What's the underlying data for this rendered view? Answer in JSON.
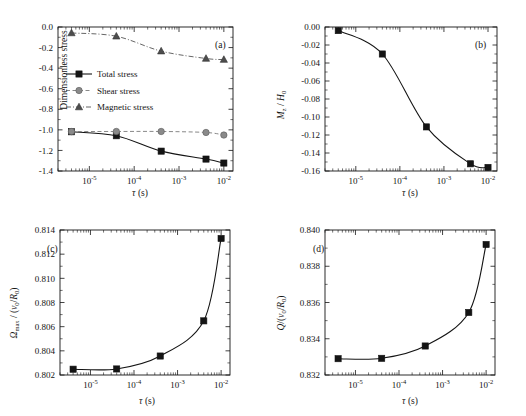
{
  "figure": {
    "background_color": "#ffffff",
    "foreground_color": "#141414",
    "shear_color": "#8a8a8a",
    "magnetic_color": "#4d4d4d"
  },
  "panels": {
    "a": {
      "tag": "(a)",
      "ylabel": "Dimensionless stress",
      "xlabel_tau": "τ",
      "xlabel_unit": " (s)",
      "ytick_labels": [
        "0.0",
        "-0.2",
        "-0.4",
        "-0.6",
        "-0.8",
        "-1.0",
        "-1.2",
        "-1.4"
      ],
      "xtick_labels": [
        "10",
        "10",
        "10",
        "10"
      ],
      "xtick_exponents": [
        "-5",
        "-4",
        "-3",
        "-2"
      ],
      "legend": [
        {
          "label": "Total stress",
          "marker": "square",
          "line": "solid"
        },
        {
          "label": "Shear stress",
          "marker": "circle",
          "line": "dashed"
        },
        {
          "label": "Magnetic stress",
          "marker": "triangle",
          "line": "dashdot"
        }
      ]
    },
    "b": {
      "tag": "(b)",
      "ylabel_m": "M",
      "ylabel_msub": "z",
      "ylabel_mid": " / ",
      "ylabel_h": "H",
      "ylabel_hsub": "0",
      "xlabel_tau": "τ",
      "xlabel_unit": " (s)",
      "ytick_labels": [
        "0.00",
        "-0.02",
        "-0.04",
        "-0.06",
        "-0.08",
        "-0.10",
        "-0.12",
        "-0.14",
        "-0.16"
      ],
      "xtick_exponents": [
        "-5",
        "-4",
        "-3",
        "-2"
      ]
    },
    "c": {
      "tag": "(c)",
      "ylabel_omega": "Ω",
      "ylabel_omegasub": "max",
      "ylabel_rest1": " / (",
      "ylabel_v": "v",
      "ylabel_vsub": "0",
      "ylabel_slash": "/",
      "ylabel_r": "R",
      "ylabel_rsub": "0",
      "ylabel_rest2": ")",
      "xlabel_tau": "τ",
      "xlabel_unit": " (s)",
      "ytick_labels": [
        "0.814",
        "0.812",
        "0.810",
        "0.808",
        "0.806",
        "0.804",
        "0.802"
      ],
      "xtick_exponents": [
        "-5",
        "-4",
        "-3",
        "-2"
      ]
    },
    "d": {
      "tag": "(d)",
      "ylabel_q": "Q",
      "ylabel_rest1": "/(",
      "ylabel_v": "v",
      "ylabel_vsub": "0",
      "ylabel_slash": "/",
      "ylabel_r": "R",
      "ylabel_rsub": "0",
      "ylabel_rest2": ")",
      "xlabel_tau": "τ",
      "xlabel_unit": " (s)",
      "ytick_labels": [
        "0.840",
        "0.838",
        "0.836",
        "0.834",
        "0.832"
      ],
      "xtick_exponents": [
        "-5",
        "-4",
        "-3",
        "-2"
      ]
    }
  },
  "chart_data": [
    {
      "id": "a",
      "type": "line",
      "title": "(a)",
      "xlabel": "τ (s)",
      "ylabel": "Dimensionless stress",
      "xscale": "log",
      "xlim": [
        2e-06,
        0.016
      ],
      "ylim": [
        -1.4,
        0.05
      ],
      "grid": false,
      "legend_position": "center-left",
      "x": [
        4e-06,
        4e-05,
        0.0004,
        0.004,
        0.01
      ],
      "series": [
        {
          "name": "Total stress",
          "marker": "square",
          "line": "solid",
          "values": [
            -1.005,
            -1.045,
            -1.2,
            -1.28,
            -1.32
          ]
        },
        {
          "name": "Shear stress",
          "marker": "circle",
          "line": "dashed",
          "values": [
            -1.003,
            -1.002,
            -1.002,
            -1.012,
            -1.038
          ]
        },
        {
          "name": "Magnetic stress",
          "marker": "triangle",
          "line": "dashdot",
          "values": [
            -0.01,
            -0.043,
            -0.193,
            -0.267,
            -0.278
          ]
        }
      ]
    },
    {
      "id": "b",
      "type": "line",
      "title": "(b)",
      "xlabel": "τ (s)",
      "ylabel": "Mz / H0",
      "xscale": "log",
      "xlim": [
        2e-06,
        0.016
      ],
      "ylim": [
        -0.16,
        0.0
      ],
      "grid": false,
      "x": [
        4e-06,
        4e-05,
        0.0004,
        0.004,
        0.01
      ],
      "series": [
        {
          "name": "Mz/H0",
          "marker": "square",
          "line": "solid",
          "values": [
            -0.004,
            -0.03,
            -0.111,
            -0.152,
            -0.156
          ]
        }
      ]
    },
    {
      "id": "c",
      "type": "line",
      "title": "(c)",
      "xlabel": "τ (s)",
      "ylabel": "Ωmax / (v0/R0)",
      "xscale": "log",
      "xlim": [
        2e-06,
        0.016
      ],
      "ylim": [
        0.802,
        0.814
      ],
      "grid": false,
      "x": [
        4e-06,
        4e-05,
        0.0004,
        0.004,
        0.01
      ],
      "series": [
        {
          "name": "Omega_max",
          "marker": "square",
          "line": "solid",
          "values": [
            0.80248,
            0.8025,
            0.80357,
            0.80648,
            0.8133
          ]
        }
      ]
    },
    {
      "id": "d",
      "type": "line",
      "title": "(d)",
      "xlabel": "τ (s)",
      "ylabel": "Q/(v0/R0)",
      "xscale": "log",
      "xlim": [
        2e-06,
        0.016
      ],
      "ylim": [
        0.832,
        0.84
      ],
      "grid": false,
      "x": [
        4e-06,
        4e-05,
        0.0004,
        0.004,
        0.01
      ],
      "series": [
        {
          "name": "Q",
          "marker": "square",
          "line": "solid",
          "values": [
            0.8329,
            0.83292,
            0.8336,
            0.83545,
            0.8392
          ]
        }
      ]
    }
  ]
}
